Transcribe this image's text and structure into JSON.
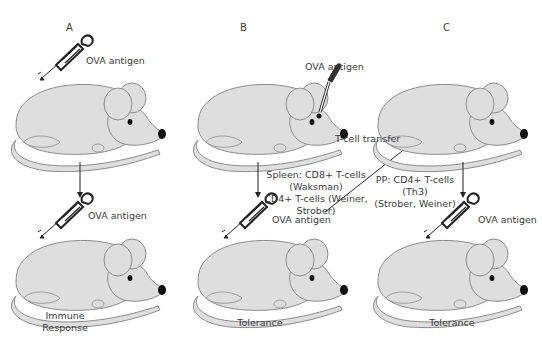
{
  "panels": [
    {
      "id": "A",
      "letter": "A",
      "top_mouse_label": "OVA antigen",
      "bottom_mouse_label": "OVA antigen",
      "outcome": [
        "Immune",
        "Response"
      ]
    },
    {
      "id": "B",
      "letter": "B",
      "top_mouse_label": "OVA antigen",
      "top_administration": "oral dropper",
      "mechanism": [
        "Spleen:  CD8+ T-cells",
        "(Waksman)",
        "CD4+ T-cells (Weiner,",
        "Strober)"
      ],
      "bottom_mouse_label": "OVA antigen",
      "outcome": [
        "Tolerance"
      ]
    },
    {
      "id": "C",
      "letter": "C",
      "transfer_label": "T-cell transfer",
      "mechanism": [
        "PP: CD4+ T-cells",
        "(Th3)",
        "(Strober, Weiner)"
      ],
      "bottom_mouse_label": "OVA antigen",
      "outcome": [
        "Tolerance"
      ]
    }
  ],
  "colors": {
    "mouse_fill": "#dedede",
    "mouse_outline": "#8c8c8c",
    "text": "#3a3a3a",
    "ink": "#222222"
  }
}
